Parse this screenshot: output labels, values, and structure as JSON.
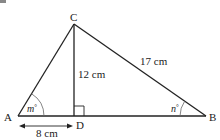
{
  "figure": {
    "points": {
      "A": {
        "label": "A",
        "x": 18,
        "y": 116
      },
      "B": {
        "label": "B",
        "x": 206,
        "y": 116
      },
      "C": {
        "label": "C",
        "x": 74,
        "y": 24
      },
      "D": {
        "label": "D",
        "x": 74,
        "y": 116
      }
    },
    "measurements": {
      "CD": "12 cm",
      "CB": "17 cm",
      "AD": "8 cm"
    },
    "angles": {
      "A": {
        "name": "m",
        "suffix": "°"
      },
      "B": {
        "name": "n",
        "suffix": "°"
      }
    },
    "right_angle_at": "D",
    "colors": {
      "line": "#222222",
      "arc": "#666666",
      "background": "#ffffff"
    }
  }
}
